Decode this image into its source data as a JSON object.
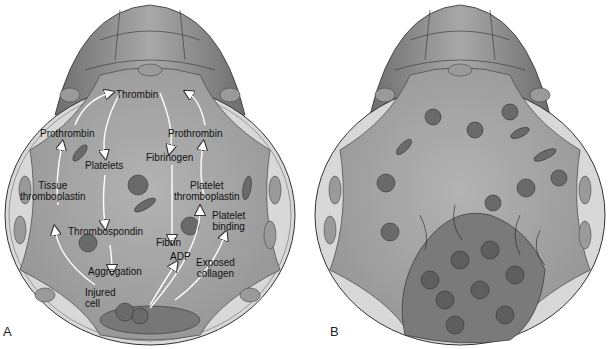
{
  "figure": {
    "panels": [
      {
        "id": "A",
        "label": "A",
        "description": "Coagulation cascade at injured vessel wall"
      },
      {
        "id": "B",
        "label": "B",
        "description": "Thrombus formation within vessel lumen"
      }
    ]
  },
  "panel_a": {
    "labels": {
      "thrombin": "Thrombin",
      "prothrombin_left": "Prothrombin",
      "prothrombin_right": "Prothrombin",
      "platelets": "Platelets",
      "fibrinogen": "Fibrinogen",
      "tissue_thromboplastin_1": "Tissue",
      "tissue_thromboplastin_2": "thromboplastin",
      "platelet_thromboplastin_1": "Platelet",
      "platelet_thromboplastin_2": "thromboplastin",
      "platelet_binding_1": "Platelet",
      "platelet_binding_2": "binding",
      "thrombospondin": "Thrombospondin",
      "fibrin": "Fibrin",
      "adp": "ADP",
      "exposed_collagen_1": "Exposed",
      "exposed_collagen_2": "collagen",
      "aggregation": "Aggregation",
      "injured_cell_1": "Injured",
      "injured_cell_2": "cell"
    }
  },
  "colors": {
    "vessel_outer": "#8a8a8a",
    "vessel_dark": "#6f6f6f",
    "endothelium": "#d9d9d9",
    "lumen": "#a5a5a5",
    "rbc": "#6a6a6a",
    "platelet": "#8c8c8c",
    "outline": "#3a3a3a"
  }
}
